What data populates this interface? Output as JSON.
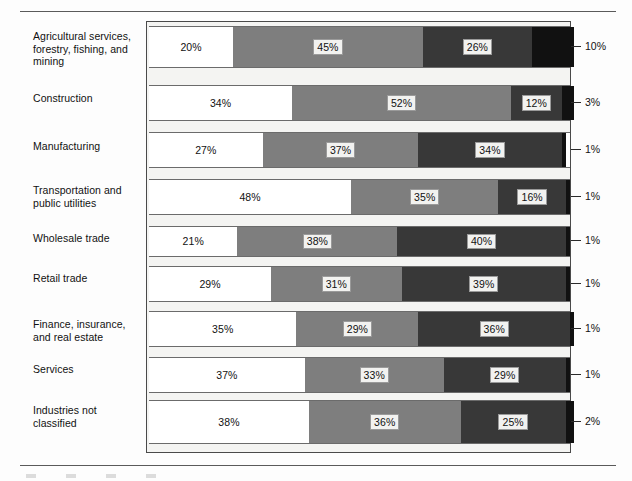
{
  "chart_data": {
    "type": "bar",
    "subtype": "stacked-horizontal-100pct",
    "title": "",
    "xlabel": "",
    "ylabel": "",
    "xlim": [
      0,
      100
    ],
    "grid": false,
    "legend_position": "bottom",
    "orientation": "horizontal",
    "stacked": true,
    "value_suffix": "%",
    "categories": [
      "Agricultural services, forestry, fishing, and mining",
      "Construction",
      "Manufacturing",
      "Transportation and public utilities",
      "Wholesale trade",
      "Retail trade",
      "Finance, insurance, and real estate",
      "Services",
      "Industries not classified"
    ],
    "series": [
      {
        "name": "series-1",
        "color": "#ffffff",
        "values": [
          20,
          34,
          27,
          48,
          21,
          29,
          35,
          37,
          38
        ]
      },
      {
        "name": "series-2",
        "color": "#7e7e7e",
        "values": [
          45,
          52,
          37,
          35,
          38,
          31,
          29,
          33,
          36
        ]
      },
      {
        "name": "series-3",
        "color": "#383838",
        "values": [
          26,
          12,
          34,
          16,
          40,
          39,
          36,
          29,
          25
        ]
      },
      {
        "name": "series-4",
        "color": "#111111",
        "values": [
          10,
          3,
          1,
          1,
          1,
          1,
          1,
          1,
          2
        ]
      }
    ],
    "right_axis_labels": [
      "10%",
      "3%",
      "1%",
      "1%",
      "1%",
      "1%",
      "1%",
      "1%",
      "2%"
    ]
  },
  "rows": [
    {
      "label": "Agricultural services, forestry, fishing, and mining",
      "tick": "10%",
      "segments": [
        {
          "value": "20%",
          "show": true
        },
        {
          "value": "45%",
          "show": true
        },
        {
          "value": "26%",
          "show": true
        },
        {
          "value": "10%",
          "show": false
        }
      ]
    },
    {
      "label": "Construction",
      "tick": "3%",
      "segments": [
        {
          "value": "34%",
          "show": true
        },
        {
          "value": "52%",
          "show": true
        },
        {
          "value": "12%",
          "show": true
        },
        {
          "value": "3%",
          "show": false
        }
      ]
    },
    {
      "label": "Manufacturing",
      "tick": "1%",
      "segments": [
        {
          "value": "27%",
          "show": true
        },
        {
          "value": "37%",
          "show": true
        },
        {
          "value": "34%",
          "show": true
        },
        {
          "value": "1%",
          "show": false
        }
      ]
    },
    {
      "label": "Transportation and public utilities",
      "tick": "1%",
      "segments": [
        {
          "value": "48%",
          "show": true
        },
        {
          "value": "35%",
          "show": true
        },
        {
          "value": "16%",
          "show": true
        },
        {
          "value": "1%",
          "show": false
        }
      ]
    },
    {
      "label": "Wholesale trade",
      "tick": "1%",
      "segments": [
        {
          "value": "21%",
          "show": true
        },
        {
          "value": "38%",
          "show": true
        },
        {
          "value": "40%",
          "show": true
        },
        {
          "value": "1%",
          "show": false
        }
      ]
    },
    {
      "label": "Retail trade",
      "tick": "1%",
      "segments": [
        {
          "value": "29%",
          "show": true
        },
        {
          "value": "31%",
          "show": true
        },
        {
          "value": "39%",
          "show": true
        },
        {
          "value": "1%",
          "show": false
        }
      ]
    },
    {
      "label": "Finance, insurance, and real estate",
      "tick": "1%",
      "segments": [
        {
          "value": "35%",
          "show": true
        },
        {
          "value": "29%",
          "show": true
        },
        {
          "value": "36%",
          "show": true
        },
        {
          "value": "1%",
          "show": false
        }
      ]
    },
    {
      "label": "Services",
      "tick": "1%",
      "segments": [
        {
          "value": "37%",
          "show": true
        },
        {
          "value": "33%",
          "show": true
        },
        {
          "value": "29%",
          "show": true
        },
        {
          "value": "1%",
          "show": false
        }
      ]
    },
    {
      "label": "Industries not classified",
      "tick": "2%",
      "segments": [
        {
          "value": "38%",
          "show": true
        },
        {
          "value": "36%",
          "show": true
        },
        {
          "value": "25%",
          "show": true
        },
        {
          "value": "2%",
          "show": false
        }
      ]
    }
  ],
  "layout": {
    "row_tops": [
      25,
      84,
      131,
      178,
      225,
      265,
      310,
      356,
      399
    ],
    "row_heights": [
      42,
      36,
      36,
      36,
      31,
      36,
      36,
      36,
      44
    ],
    "label_tops": [
      30,
      92,
      140,
      184,
      232,
      272,
      318,
      363,
      404
    ]
  }
}
